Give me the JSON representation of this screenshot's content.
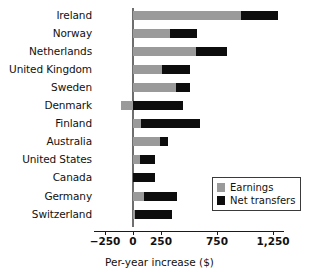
{
  "chart_data": {
    "type": "bar",
    "orientation": "horizontal",
    "stacked": true,
    "title": "",
    "xlabel": "Per-year increase ($)",
    "ylabel": "",
    "xlim": [
      -250,
      1375
    ],
    "xticks": [
      -250,
      0,
      250,
      750,
      1250
    ],
    "xticklabels": [
      "−250",
      "0",
      "250",
      "750",
      "1,250"
    ],
    "grid": false,
    "legend_position": "lower right",
    "categories": [
      "Ireland",
      "Norway",
      "Netherlands",
      "United Kingdom",
      "Sweden",
      "Denmark",
      "Finland",
      "Australia",
      "United States",
      "Canada",
      "Germany",
      "Switzerland"
    ],
    "series": [
      {
        "name": "Earnings",
        "color": "#9a9a9a",
        "values": [
          964,
          330,
          563,
          259,
          384,
          -107,
          71,
          241,
          62,
          0,
          98,
          18
        ]
      },
      {
        "name": "Net transfers",
        "color": "#0d0d0d",
        "values": [
          330,
          241,
          277,
          250,
          125,
          446,
          527,
          71,
          134,
          196,
          295,
          330
        ]
      }
    ],
    "totals": [
      1294,
      571,
      840,
      509,
      509,
      339,
      598,
      312,
      196,
      196,
      393,
      348
    ]
  },
  "legend": {
    "items": [
      {
        "label": "Earnings",
        "swatch": "earnings-swatch"
      },
      {
        "label": "Net transfers",
        "swatch": "net-transfers-swatch"
      }
    ]
  },
  "axis": {
    "x_title": "Per-year increase ($)"
  }
}
